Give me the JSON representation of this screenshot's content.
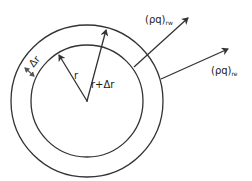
{
  "diagram": {
    "labels": {
      "r": "r",
      "r_plus_dr": "r+Δr",
      "dr": "Δr",
      "flux_rw_main": "(ρq)",
      "flux_rw_sub": "rw",
      "flux_re_main": "(ρq)",
      "flux_re_sub": "re"
    },
    "colors": {
      "stroke": "#333333",
      "background": "#ffffff"
    },
    "geometry": {
      "center": [
        87,
        101
      ],
      "inner_radius": 56,
      "outer_radius": 76
    }
  }
}
